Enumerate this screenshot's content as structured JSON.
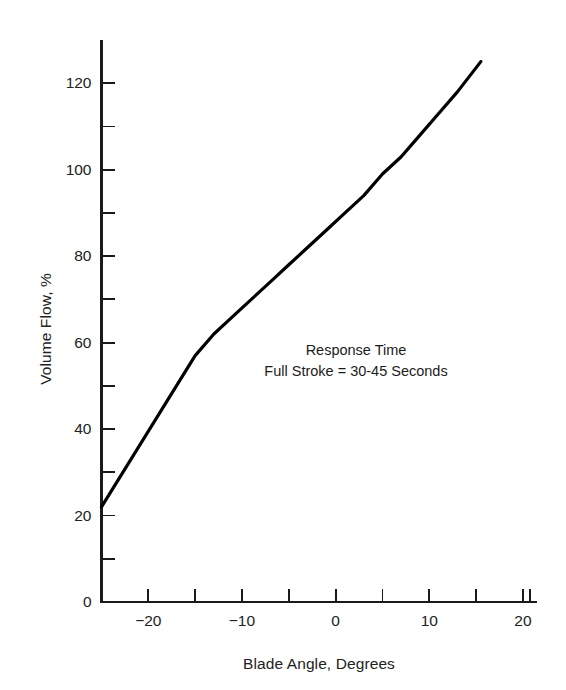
{
  "figure": {
    "background_color": "#ffffff",
    "axis_color": "#1a1a1a",
    "curve_color": "#000000"
  },
  "annotation": {
    "line1": "Response Time",
    "line2": "Full Stroke = 30-45 Seconds"
  },
  "chart_data": {
    "type": "line",
    "title": "",
    "subtitle": "",
    "xlabel": "Blade Angle, Degrees",
    "ylabel": "Volume Flow, %",
    "xlim": [
      -25,
      21.5
    ],
    "ylim": [
      0,
      130
    ],
    "grid": false,
    "legend": null,
    "x_major_ticks": [
      -20,
      -10,
      0,
      10,
      20
    ],
    "x_major_tick_labels": [
      "−20",
      "−10",
      "0",
      "10",
      "20"
    ],
    "x_minor_ticks": [
      -25,
      -15,
      -5,
      5,
      15
    ],
    "y_major_ticks": [
      0,
      20,
      40,
      60,
      80,
      100,
      120
    ],
    "y_major_tick_labels": [
      "0",
      "20",
      "40",
      "60",
      "80",
      "100",
      "120"
    ],
    "y_minor_ticks": [
      10,
      30,
      50,
      70,
      90,
      110,
      130
    ],
    "annotations": [
      {
        "text": "Response Time\nFull Stroke = 30-45 Seconds",
        "x": -3,
        "y": 59
      }
    ],
    "series": [
      {
        "name": "Volume Flow vs Blade Angle",
        "color": "#000000",
        "line_width": 3.2,
        "x": [
          -25,
          -23,
          -21,
          -19,
          -17,
          -15,
          -13,
          -11,
          -9,
          -7,
          -5,
          -3,
          -1,
          1,
          3,
          5,
          7,
          9,
          11,
          13,
          15.5
        ],
        "y": [
          22,
          29,
          36,
          43,
          50,
          57,
          62,
          66,
          70,
          74,
          78,
          82,
          86,
          90,
          94,
          99,
          103,
          108,
          113,
          118,
          125
        ]
      }
    ]
  }
}
